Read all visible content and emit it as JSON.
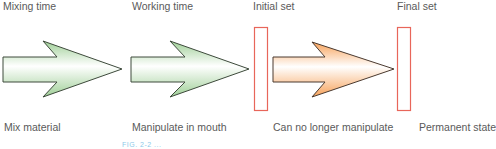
{
  "phases_top": [
    {
      "label": "Mixing time"
    },
    {
      "label": "Working time"
    },
    {
      "label": "Initial set"
    },
    {
      "label": "Final set"
    }
  ],
  "phases_bottom": [
    {
      "label": "Mix material"
    },
    {
      "label": "Manipulate in mouth"
    },
    {
      "label": "Can no longer manipulate"
    },
    {
      "label": "Permanent state"
    }
  ],
  "arrows": [
    {
      "name": "mixing-arrow",
      "color": "#a8d4a0"
    },
    {
      "name": "working-arrow",
      "color": "#a8d4a0"
    },
    {
      "name": "setting-arrow",
      "color": "#f7a661"
    }
  ],
  "markers": [
    {
      "name": "initial-set-marker",
      "color": "#e8665a"
    },
    {
      "name": "final-set-marker",
      "color": "#e8665a"
    }
  ],
  "caption": {
    "text": "FIG. 2-2 ..."
  }
}
